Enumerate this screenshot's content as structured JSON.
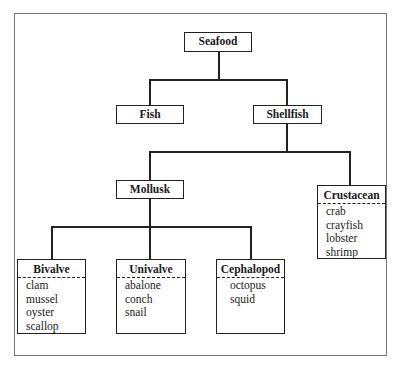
{
  "diagram": {
    "root": "Seafood",
    "level1": [
      "Fish",
      "Shellfish"
    ],
    "shellfish_children": [
      "Mollusk",
      "Crustacean"
    ],
    "crustacean": {
      "title": "Crustacean",
      "items": [
        "crab",
        "crayfish",
        "lobster",
        "shrimp"
      ]
    },
    "mollusk_children": [
      {
        "title": "Bivalve",
        "items": [
          "clam",
          "mussel",
          "oyster",
          "scallop"
        ]
      },
      {
        "title": "Univalve",
        "items": [
          "abalone",
          "conch",
          "snail"
        ]
      },
      {
        "title": "Cephalopod",
        "items": [
          "octopus",
          "squid"
        ]
      }
    ]
  }
}
